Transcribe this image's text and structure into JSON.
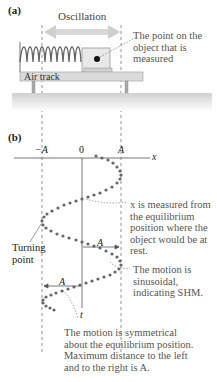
{
  "panel_a": {
    "label": "(a)",
    "oscillation_label": "Oscillation",
    "track_label": "Air track",
    "point_callout": "The point on the object that is measured"
  },
  "panel_b": {
    "label": "(b)",
    "axis_ticks": [
      "−A",
      "0",
      "A"
    ],
    "x_axis_label": "x",
    "t_axis_label": "t",
    "amplitude_label": "A",
    "turning_point_label": "Turning point",
    "callouts": {
      "x_measured": "x is measured from the equilibrium position where the object would be at rest.",
      "sinusoidal": "The motion is sinusoidal, indicating SHM.",
      "symmetrical": "The motion is symmetrical about the equilibrium position. Maximum distance to the left and to the right is A."
    }
  },
  "colors": {
    "arrow": "#d9d9d9",
    "glider": "#e6e6e6",
    "track": "#d8d8d8",
    "ground": "#dcdcdc",
    "dots": "#666666",
    "callout_text": "#555555"
  }
}
